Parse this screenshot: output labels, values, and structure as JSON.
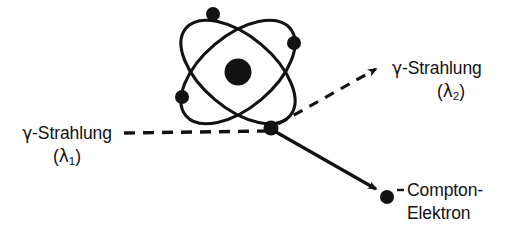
{
  "figure": {
    "width": 518,
    "height": 229,
    "background_color": "#ffffff",
    "stroke_color": "#121212"
  },
  "labels": {
    "incoming_gamma": {
      "line1_prefix": "γ",
      "line1_rest": "-Strahlung",
      "line2_open": "(",
      "line2_symbol": "λ",
      "line2_subscript": "1",
      "line2_close": ")"
    },
    "scattered_gamma": {
      "line1_prefix": "γ",
      "line1_rest": "-Strahlung",
      "line2_open": "(",
      "line2_symbol": "λ",
      "line2_subscript": "2",
      "line2_close": ")"
    },
    "compton_electron": {
      "line1": "Compton-",
      "line2": "Elektron",
      "charge_sign": "–"
    }
  },
  "atom": {
    "nucleus": {
      "cx": 238,
      "cy": 72,
      "r": 13.5
    },
    "orbits": [
      {
        "cx": 238,
        "cy": 72,
        "rx": 68,
        "ry": 36,
        "rotation": 40
      },
      {
        "cx": 238,
        "cy": 72,
        "rx": 68,
        "ry": 36,
        "rotation": -40
      }
    ],
    "electrons": [
      {
        "name": "electron-top",
        "cx": 213,
        "cy": 14,
        "r": 7
      },
      {
        "name": "electron-right",
        "cx": 294,
        "cy": 43,
        "r": 7
      },
      {
        "name": "electron-left",
        "cx": 182,
        "cy": 97,
        "r": 7
      },
      {
        "name": "electron-interaction",
        "cx": 271,
        "cy": 128,
        "r": 7.5
      }
    ]
  },
  "rays": {
    "incoming_gamma": {
      "style": "dashed",
      "x1": 124,
      "y1": 133,
      "x2": 271,
      "y2": 131,
      "dash": "11 8"
    },
    "scattered_gamma": {
      "style": "dashed",
      "x1": 274,
      "y1": 126,
      "x2": 372,
      "y2": 71,
      "dash": "10 8",
      "arrowhead": true
    },
    "compton_electron": {
      "style": "solid",
      "x1": 274,
      "y1": 132,
      "x2": 372,
      "y2": 188,
      "arrowhead": true
    }
  },
  "free_electron": {
    "cx": 387,
    "cy": 197,
    "r": 7
  }
}
